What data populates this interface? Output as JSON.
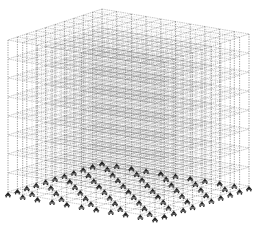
{
  "diagram": {
    "type": "3d-structural-frame",
    "floors": 8,
    "grid_x": 10,
    "grid_y": 10,
    "supports": "fixed-support symbols under every base column",
    "colors": {
      "background": "#ffffff",
      "frame_line": "#555555",
      "slab_dense": "#6a6a6a",
      "node": "#222222"
    },
    "geometry": {
      "top_back": [
        102,
        9
      ],
      "top_left": [
        8,
        40
      ],
      "top_right": [
        249,
        34
      ],
      "top_front": [
        155,
        66
      ],
      "floor_spacing": 19,
      "base_offset": 152
    }
  }
}
